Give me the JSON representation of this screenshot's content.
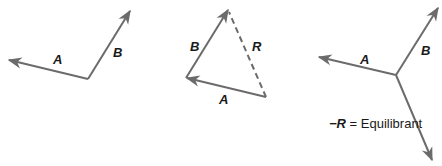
{
  "colors": {
    "vector": "#6b6b6b",
    "text": "#1a1a1a",
    "background": "#ffffff"
  },
  "figures": [
    {
      "name": "vectors-a-b",
      "labels": {
        "a": "A",
        "b": "B"
      }
    },
    {
      "name": "resultant-triangle",
      "labels": {
        "a": "A",
        "b": "B",
        "r": "R"
      }
    },
    {
      "name": "equilibrant",
      "labels": {
        "a": "A",
        "b": "B"
      },
      "caption": {
        "neg_r": "−R",
        "equals": " = Equilibrant"
      }
    }
  ]
}
